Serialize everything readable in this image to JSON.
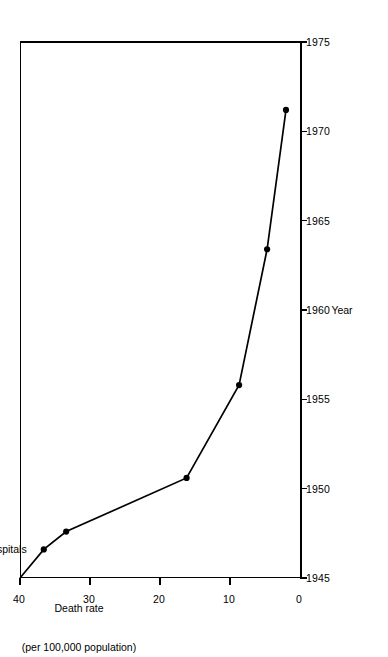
{
  "chart_data": {
    "type": "line",
    "title": "",
    "xlabel": "Year",
    "ylabel": "Death rate\n(per 100,000 population)",
    "ylabel_line1": "Death rate",
    "ylabel_line2": "(per 100,000 population)",
    "x": [
      1945,
      1946.6,
      1947.6,
      1950.6,
      1955.8,
      1963.4,
      1971.2
    ],
    "values": [
      40.0,
      36.6,
      33.4,
      16.2,
      8.7,
      4.7,
      2.0
    ],
    "xlim": [
      1945,
      1975
    ],
    "ylim": [
      0,
      40
    ],
    "xticks": [
      1945,
      1950,
      1955,
      1960,
      1965,
      1970,
      1975
    ],
    "xticklabels": [
      "1945",
      "1950",
      "1955",
      "1960",
      "1965",
      "1970",
      "1975"
    ],
    "yticks": [
      0,
      10,
      20,
      30,
      40
    ],
    "yticklabels": [
      "0",
      "10",
      "20",
      "30",
      "40"
    ],
    "grid": false,
    "legend": null,
    "marker": "filled-circle",
    "line_color": "#000000",
    "rotation": "-90deg",
    "annotations": [
      {
        "id": "penicillin-hospitals",
        "text": "Introduction of penicillin in hospitals",
        "x": 1945.0,
        "y": 40.0
      },
      {
        "id": "general-penicillin-streptomycin",
        "text": "General distribution of penicillin; streptomycin introduced in hospitals",
        "x": 1946.6,
        "y": 36.6
      },
      {
        "id": "general-streptomycin",
        "text": "General distribution of streptomycin",
        "x": 1947.6,
        "y": 33.4
      },
      {
        "id": "isoniazid",
        "text": "Introduction of isoniazid",
        "x": 1950.6,
        "y": 16.2
      },
      {
        "id": "pas",
        "text": "Introduction of PAS",
        "x": 1955.8,
        "y": 8.7
      },
      {
        "id": "myambutol",
        "text": "Introduction\nof myambutol",
        "line1": "Introduction",
        "line2": "of myambutol",
        "x": 1963.4,
        "y": 4.7
      },
      {
        "id": "rifampin",
        "text": "Introduction\nof rifampin",
        "line1": "Introduction",
        "line2": "of rifampin",
        "x": 1971.2,
        "y": 2.0
      }
    ]
  }
}
